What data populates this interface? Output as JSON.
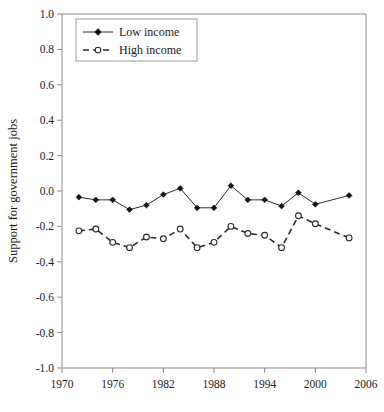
{
  "chart_data": {
    "type": "line",
    "title": "",
    "xlabel": "",
    "ylabel": "Support for government jobs",
    "xlim": [
      1970,
      2006
    ],
    "ylim": [
      -1.0,
      1.0
    ],
    "grid": false,
    "legend_position": "top-left",
    "xticks": [
      1970,
      1976,
      1982,
      1988,
      1994,
      2000,
      2006
    ],
    "xtick_labels": [
      "1970",
      "1976",
      "1982",
      "1988",
      "1994",
      "2000",
      "2006"
    ],
    "yticks": [
      1.0,
      0.8,
      0.6,
      0.4,
      0.2,
      0.0,
      -0.2,
      -0.4,
      -0.6,
      -0.8,
      -1.0
    ],
    "ytick_labels": [
      "1.0",
      "0.8",
      "0.6",
      "0.4",
      "0.2",
      "0.0",
      "-0.2",
      "-0.4",
      "-0.6",
      "-0.8",
      "-1.0"
    ],
    "x": [
      1972,
      1974,
      1976,
      1978,
      1980,
      1982,
      1984,
      1986,
      1988,
      1990,
      1992,
      1994,
      1996,
      1998,
      2000,
      2004
    ],
    "series": [
      {
        "name": "Low income",
        "marker": "filled-diamond",
        "line_style": "solid",
        "color": "#111111",
        "values": [
          -0.035,
          -0.05,
          -0.05,
          -0.105,
          -0.08,
          -0.02,
          0.015,
          -0.095,
          -0.095,
          0.03,
          -0.05,
          -0.05,
          -0.085,
          -0.01,
          -0.075,
          -0.025
        ]
      },
      {
        "name": "High income",
        "marker": "open-circle",
        "line_style": "dashed",
        "color": "#2b2b2b",
        "values": [
          -0.225,
          -0.215,
          -0.29,
          -0.32,
          -0.26,
          -0.27,
          -0.215,
          -0.32,
          -0.29,
          -0.2,
          -0.24,
          -0.25,
          -0.32,
          -0.14,
          -0.185,
          -0.265
        ]
      }
    ]
  },
  "legend": {
    "items": [
      {
        "label": "Low income"
      },
      {
        "label": "High income"
      }
    ]
  }
}
